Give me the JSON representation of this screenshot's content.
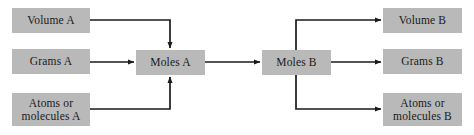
{
  "diagram": {
    "colors": {
      "box_fill": "#b9b9b9",
      "line": "#1a1a1a",
      "text": "#1a1a1a",
      "background": "#ffffff"
    },
    "nodes": [
      {
        "id": "volume-a",
        "label": "Volume A",
        "x": 12,
        "y": 8,
        "w": 78,
        "h": 25
      },
      {
        "id": "grams-a",
        "label": "Grams A",
        "x": 12,
        "y": 49,
        "w": 78,
        "h": 25
      },
      {
        "id": "atoms-a",
        "label": "Atoms or\nmolecules A",
        "x": 12,
        "y": 93,
        "w": 78,
        "h": 33
      },
      {
        "id": "moles-a",
        "label": "Moles A",
        "x": 136,
        "y": 50,
        "w": 69,
        "h": 25
      },
      {
        "id": "moles-b",
        "label": "Moles B",
        "x": 262,
        "y": 50,
        "w": 69,
        "h": 25
      },
      {
        "id": "volume-b",
        "label": "Volume B",
        "x": 383,
        "y": 8,
        "w": 79,
        "h": 25
      },
      {
        "id": "grams-b",
        "label": "Grams B",
        "x": 383,
        "y": 49,
        "w": 79,
        "h": 25
      },
      {
        "id": "atoms-b",
        "label": "Atoms or\nmolecules B",
        "x": 383,
        "y": 93,
        "w": 79,
        "h": 33
      }
    ],
    "connectors": [
      {
        "id": "volume-a-to-moles-a",
        "from": "volume-a",
        "to": "moles-a",
        "points": "90,20 170,20 170,48"
      },
      {
        "id": "grams-a-to-moles-a",
        "from": "grams-a",
        "to": "moles-a",
        "points": "90,62 134,62"
      },
      {
        "id": "atoms-a-to-moles-a",
        "from": "atoms-a",
        "to": "moles-a",
        "points": "90,109 170,109 170,77"
      },
      {
        "id": "moles-a-to-moles-b",
        "from": "moles-a",
        "to": "moles-b",
        "points": "205,62 260,62"
      },
      {
        "id": "moles-b-to-volume-b",
        "from": "moles-b",
        "to": "volume-b",
        "points": "296,50 296,20 381,20"
      },
      {
        "id": "moles-b-to-grams-b",
        "from": "moles-b",
        "to": "grams-b",
        "points": "331,62 381,62"
      },
      {
        "id": "moles-b-to-atoms-b",
        "from": "moles-b",
        "to": "atoms-b",
        "points": "296,75 296,109 381,109"
      }
    ]
  }
}
